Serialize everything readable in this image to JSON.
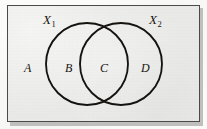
{
  "figure": {
    "type": "venn-diagram",
    "background_color": "#e9e9e7",
    "border_color": "#4a4a48",
    "stroke_color": "#15130f",
    "text_color": "#17150f"
  },
  "set_labels": [
    {
      "id": "x1",
      "base": "X",
      "subscript": "1",
      "full": "X₁"
    },
    {
      "id": "x2",
      "base": "X",
      "subscript": "2",
      "full": "X₂"
    }
  ],
  "region_labels": [
    {
      "id": "a",
      "text": "A",
      "region": "outside-both-circles"
    },
    {
      "id": "b",
      "text": "B",
      "region": "left-circle-only"
    },
    {
      "id": "c",
      "text": "C",
      "region": "intersection"
    },
    {
      "id": "d",
      "text": "D",
      "region": "right-circle-only"
    }
  ],
  "geometry": {
    "panel": {
      "x": 7,
      "y": 5,
      "width": 193,
      "height": 117
    },
    "left_circle": {
      "cx": 87,
      "cy": 64,
      "r": 41
    },
    "right_circle": {
      "cx": 121,
      "cy": 64,
      "r": 41
    },
    "intersection_top": {
      "x": 104,
      "y": 23
    },
    "intersection_bottom": {
      "x": 104,
      "y": 105
    }
  }
}
